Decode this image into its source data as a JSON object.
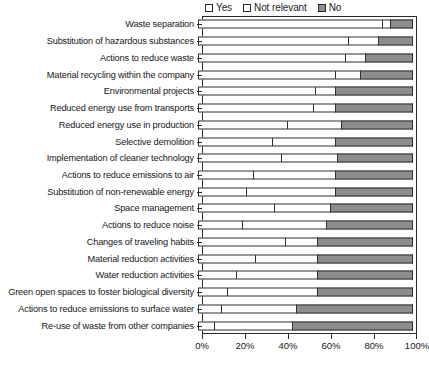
{
  "chart_data": {
    "type": "bar",
    "orientation": "horizontal",
    "stacked": true,
    "normalized_percent": true,
    "title": "",
    "subtitle": "",
    "xlabel": "",
    "ylabel": "",
    "xlim": [
      0,
      100
    ],
    "xticks": [
      0,
      20,
      40,
      60,
      80,
      100
    ],
    "xticklabels": [
      "0%",
      "20%",
      "40%",
      "60%",
      "80%",
      "100%"
    ],
    "grid": false,
    "legend_position": "top-right",
    "legend": [
      "Yes",
      "Not relevant",
      "No"
    ],
    "colors": {
      "yes": "#ffffff",
      "not_relevant": "#ffffff",
      "no": "#8d8d8d",
      "outline": "#2f2f2f",
      "text": "#161616",
      "background": "#ffffff"
    },
    "categories": [
      "Waste separation",
      "Substitution of hazardous substances",
      "Actions to reduce waste",
      "Material recycling within the company",
      "Environmental projects",
      "Reduced energy use from transports",
      "Reduced energy use in production",
      "Selective demolition",
      "Implementation of cleaner technology",
      "Actions to reduce emissions to air",
      "Substitution of non-renewable energy",
      "Space management",
      "Actions to reduce noise",
      "Changes of traveling habits",
      "Material reduction activities",
      "Water reduction activities",
      "Green open spaces to foster biological diversity",
      "Actions to reduce emissions to surface water",
      "Re-use of waste from other companies"
    ],
    "series": [
      {
        "name": "Yes",
        "values": [
          86,
          70,
          69,
          64,
          55,
          54,
          42,
          35,
          39,
          26,
          23,
          36,
          21,
          41,
          27,
          18,
          14,
          11,
          8
        ]
      },
      {
        "name": "Not relevant",
        "values": [
          4,
          14,
          9,
          12,
          9,
          10,
          25,
          29,
          26,
          38,
          41,
          26,
          39,
          15,
          29,
          38,
          42,
          35,
          36
        ]
      },
      {
        "name": "No",
        "values": [
          10,
          16,
          22,
          24,
          36,
          36,
          33,
          36,
          35,
          36,
          36,
          38,
          40,
          44,
          44,
          44,
          44,
          54,
          56
        ]
      }
    ]
  }
}
